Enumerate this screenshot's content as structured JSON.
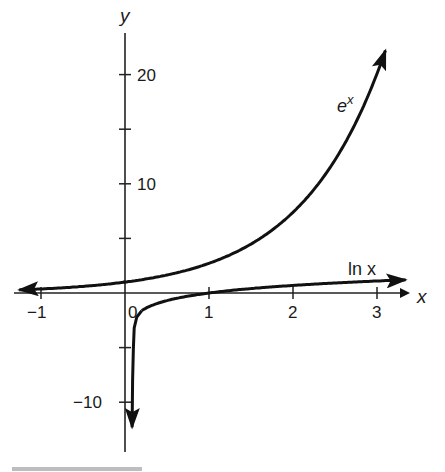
{
  "chart_data": {
    "type": "line",
    "title": "",
    "xlabel": "x",
    "ylabel": "y",
    "xlim": [
      -1.3,
      3.4
    ],
    "ylim": [
      -13,
      24
    ],
    "grid": false,
    "x_ticks": [
      -1,
      0,
      1,
      2,
      3
    ],
    "x_tick_labels": [
      "−1",
      "0",
      "1",
      "2",
      "3"
    ],
    "y_ticks": [
      -10,
      -5,
      5,
      10,
      15,
      20
    ],
    "y_tick_labels": [
      "−10",
      "",
      "",
      "10",
      "",
      "20"
    ],
    "series": [
      {
        "name": "e^x",
        "label_base": "e",
        "label_sup": "x",
        "x": [
          -1.25,
          -1,
          -0.5,
          0,
          0.5,
          1,
          1.5,
          2,
          2.5,
          3,
          3.1
        ],
        "values": [
          0.29,
          0.37,
          0.61,
          1.0,
          1.65,
          2.72,
          4.48,
          7.39,
          12.18,
          20.09,
          22.2
        ]
      },
      {
        "name": "ln x",
        "label": "ln x",
        "x": [
          0.08,
          0.1,
          0.2,
          0.5,
          1,
          1.5,
          2,
          2.5,
          3,
          3.3
        ],
        "values": [
          -12.0,
          -2.3,
          -1.61,
          -0.69,
          0,
          0.41,
          0.69,
          0.92,
          1.1,
          1.19
        ]
      }
    ],
    "annotations": [
      "e^x",
      "ln x"
    ]
  }
}
